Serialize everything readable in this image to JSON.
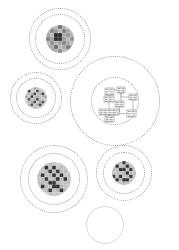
{
  "figure": {
    "type": "diagram",
    "title": "",
    "background_color": "#ffffff",
    "ring_color": "#9a9a9a",
    "ring_style": "dotted",
    "empty_ring_color": "#d8d8d8",
    "empty_ring_style": "solid"
  },
  "clusters": [
    {
      "id": "cluster-top",
      "name": "top-grid-cluster",
      "label": "",
      "center_x": 60,
      "center_y": 39,
      "outer_radius": 31,
      "rings": [
        31,
        25
      ],
      "content_type": "grid-heatmap",
      "content_radius": 14,
      "grid_cols": 7,
      "grid_rows": 7,
      "grid_values": [
        [
          0.46,
          0.4,
          0.3,
          0.62,
          0.34,
          0.26,
          0.4
        ],
        [
          0.34,
          0.52,
          0.44,
          0.3,
          0.55,
          0.38,
          0.3
        ],
        [
          0.4,
          0.3,
          0.95,
          0.92,
          0.36,
          0.45,
          0.35
        ],
        [
          0.55,
          0.42,
          0.9,
          0.88,
          0.44,
          0.3,
          0.48
        ],
        [
          0.3,
          0.48,
          0.34,
          0.4,
          0.52,
          0.36,
          0.3
        ],
        [
          0.42,
          0.36,
          0.62,
          0.3,
          0.38,
          0.58,
          0.42
        ],
        [
          0.3,
          0.45,
          0.34,
          0.5,
          0.3,
          0.36,
          0.3
        ]
      ]
    },
    {
      "id": "cluster-left",
      "name": "left-grid-cluster",
      "label": "",
      "center_x": 36,
      "center_y": 98,
      "outer_radius": 26,
      "rings": [
        26,
        20
      ],
      "content_type": "grid-heatmap",
      "content_radius": 11,
      "grid_cols": 8,
      "grid_rows": 8,
      "grid_values": [
        [
          0.2,
          0.3,
          0.22,
          0.4,
          0.26,
          0.18,
          0.3,
          0.2
        ],
        [
          0.3,
          0.86,
          0.24,
          0.22,
          0.78,
          0.3,
          0.22,
          0.28
        ],
        [
          0.24,
          0.3,
          0.34,
          0.8,
          0.26,
          0.34,
          0.82,
          0.22
        ],
        [
          0.4,
          0.22,
          0.84,
          0.28,
          0.36,
          0.26,
          0.3,
          0.4
        ],
        [
          0.22,
          0.76,
          0.26,
          0.34,
          0.8,
          0.3,
          0.24,
          0.26
        ],
        [
          0.3,
          0.24,
          0.36,
          0.78,
          0.22,
          0.38,
          0.74,
          0.3
        ],
        [
          0.26,
          0.34,
          0.74,
          0.24,
          0.36,
          0.8,
          0.26,
          0.24
        ],
        [
          0.2,
          0.26,
          0.22,
          0.34,
          0.24,
          0.26,
          0.3,
          0.2
        ]
      ]
    },
    {
      "id": "cluster-center-large",
      "name": "center-network-cluster",
      "label": "",
      "center_x": 115,
      "center_y": 101,
      "outer_radius": 45,
      "rings": [
        45,
        24
      ],
      "content_type": "node-link",
      "content_radius": 24
    },
    {
      "id": "cluster-bottom-left",
      "name": "bottom-left-grid-cluster",
      "label": "",
      "center_x": 54,
      "center_y": 179,
      "outer_radius": 34,
      "rings": [
        34,
        26
      ],
      "content_type": "grid-heatmap",
      "content_radius": 17,
      "grid_cols": 9,
      "grid_rows": 9,
      "grid_values": [
        [
          0.18,
          0.22,
          0.26,
          0.3,
          0.24,
          0.2,
          0.26,
          0.22,
          0.18
        ],
        [
          0.22,
          0.3,
          0.88,
          0.26,
          0.9,
          0.24,
          0.3,
          0.26,
          0.22
        ],
        [
          0.26,
          0.24,
          0.3,
          0.86,
          0.28,
          0.84,
          0.26,
          0.3,
          0.24
        ],
        [
          0.3,
          0.86,
          0.26,
          0.3,
          0.88,
          0.26,
          0.86,
          0.24,
          0.28
        ],
        [
          0.24,
          0.28,
          0.84,
          0.26,
          0.3,
          0.88,
          0.28,
          0.86,
          0.24
        ],
        [
          0.28,
          0.3,
          0.26,
          0.88,
          0.86,
          0.3,
          0.26,
          0.28,
          0.3
        ],
        [
          0.22,
          0.86,
          0.3,
          0.26,
          0.9,
          0.88,
          0.3,
          0.24,
          0.26
        ],
        [
          0.26,
          0.24,
          0.3,
          0.84,
          0.26,
          0.3,
          0.86,
          0.28,
          0.22
        ],
        [
          0.18,
          0.26,
          0.22,
          0.28,
          0.24,
          0.26,
          0.22,
          0.2,
          0.18
        ]
      ]
    },
    {
      "id": "cluster-bottom-right",
      "name": "bottom-right-grid-cluster",
      "label": "",
      "center_x": 124,
      "center_y": 173,
      "outer_radius": 28,
      "rings": [
        28,
        21
      ],
      "content_type": "grid-heatmap",
      "content_radius": 12,
      "grid_cols": 7,
      "grid_rows": 7,
      "grid_values": [
        [
          0.2,
          0.26,
          0.3,
          0.84,
          0.26,
          0.22,
          0.2
        ],
        [
          0.24,
          0.86,
          0.26,
          0.3,
          0.88,
          0.26,
          0.22
        ],
        [
          0.3,
          0.26,
          0.9,
          0.88,
          0.26,
          0.86,
          0.24
        ],
        [
          0.26,
          0.3,
          0.26,
          0.3,
          0.88,
          0.26,
          0.3
        ],
        [
          0.84,
          0.26,
          0.88,
          0.26,
          0.3,
          0.86,
          0.26
        ],
        [
          0.24,
          0.86,
          0.3,
          0.9,
          0.88,
          0.26,
          0.22
        ],
        [
          0.2,
          0.24,
          0.26,
          0.3,
          0.26,
          0.22,
          0.2
        ]
      ]
    },
    {
      "id": "cluster-empty",
      "name": "empty-cluster",
      "label": "",
      "center_x": 105,
      "center_y": 225,
      "outer_radius": 19,
      "rings": [
        19
      ],
      "content_type": "empty"
    }
  ],
  "network": {
    "name": "center-node-link-diagram",
    "nodes": [
      {
        "id": "n1",
        "label": "",
        "x": 14,
        "y": 11,
        "w": 9,
        "h": 7
      },
      {
        "id": "n2",
        "label": "",
        "x": 13,
        "y": 19,
        "w": 10,
        "h": 6
      },
      {
        "id": "n3",
        "label": "",
        "x": 26,
        "y": 10,
        "w": 8,
        "h": 6
      },
      {
        "id": "n4",
        "label": "",
        "x": 38,
        "y": 17,
        "w": 8,
        "h": 6
      },
      {
        "id": "n5",
        "label": "",
        "x": 24,
        "y": 24,
        "w": 9,
        "h": 6
      },
      {
        "id": "n6",
        "label": "",
        "x": 8,
        "y": 32,
        "w": 20,
        "h": 6
      },
      {
        "id": "n7",
        "label": "",
        "x": 14,
        "y": 39,
        "w": 9,
        "h": 6
      },
      {
        "id": "n8",
        "label": "",
        "x": 36,
        "y": 33,
        "w": 9,
        "h": 7
      }
    ],
    "edges": [
      {
        "from": "n1",
        "to": "n3"
      },
      {
        "from": "n1",
        "to": "n2"
      },
      {
        "from": "n3",
        "to": "n5"
      },
      {
        "from": "n3",
        "to": "n4"
      },
      {
        "from": "n5",
        "to": "n6"
      },
      {
        "from": "n6",
        "to": "n7"
      },
      {
        "from": "n6",
        "to": "n8"
      },
      {
        "from": "n4",
        "to": "n8"
      },
      {
        "from": "n2",
        "to": "n6"
      }
    ]
  }
}
